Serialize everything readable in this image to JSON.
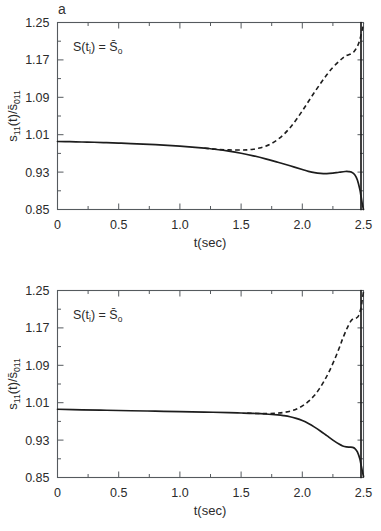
{
  "figure": {
    "panels": [
      {
        "label": "a",
        "annotation_main": "S(t",
        "annotation_sub1": "i",
        "annotation_mid": ") = S",
        "annotation_sub2": "o",
        "annotation_full": "S(ti) = S̄o"
      },
      {
        "label": "b",
        "annotation_main": "S(t",
        "annotation_sub1": "i",
        "annotation_mid": ") = S",
        "annotation_sub2": "o",
        "annotation_full": "S(ti) = S̄o"
      }
    ],
    "axes": {
      "xlabel": "t(sec)",
      "ylabel_main": "s",
      "ylabel_sub1": "11",
      "ylabel_mid": "(t)/s",
      "ylabel_sub2": "011",
      "ylabel_full": "s11(t)/s̄011",
      "xticks": [
        "0",
        "0.5",
        "1.0",
        "1.5",
        "2.0",
        "2.5"
      ],
      "yticks": [
        "0.85",
        "0.93",
        "1.01",
        "1.09",
        "1.17",
        "1.25"
      ]
    },
    "colors": {
      "background": "#ffffff",
      "frame": "#555a5e",
      "curve": "#1d1d1d",
      "text": "#2b2b2b"
    }
  },
  "chart_data": [
    {
      "type": "line",
      "title": "a",
      "xlabel": "t(sec)",
      "ylabel": "s11(t)/s̄011",
      "xlim": [
        0,
        2.5
      ],
      "ylim": [
        0.85,
        1.25
      ],
      "xticks": [
        0,
        0.5,
        1.0,
        1.5,
        2.0,
        2.5
      ],
      "yticks": [
        0.85,
        0.93,
        1.01,
        1.09,
        1.17,
        1.25
      ],
      "grid": false,
      "legend": "none",
      "annotations": [
        "S(ti) = S̄o"
      ],
      "minor_ticks_per_interval": 1,
      "series": [
        {
          "name": "solid",
          "style": "solid",
          "x": [
            0.0,
            0.1,
            0.2,
            0.3,
            0.4,
            0.5,
            0.6,
            0.7,
            0.8,
            0.9,
            1.0,
            1.1,
            1.2,
            1.3,
            1.4,
            1.5,
            1.6,
            1.7,
            1.8,
            1.9,
            2.0,
            2.05,
            2.1,
            2.15,
            2.2,
            2.25,
            2.3,
            2.35,
            2.38,
            2.4,
            2.43,
            2.45,
            2.47,
            2.48,
            2.49,
            2.5
          ],
          "y": [
            0.9955,
            0.995,
            0.9944,
            0.9938,
            0.993,
            0.9921,
            0.9911,
            0.9899,
            0.9886,
            0.9872,
            0.9855,
            0.9836,
            0.9812,
            0.9784,
            0.9748,
            0.9703,
            0.9648,
            0.9583,
            0.951,
            0.9435,
            0.9355,
            0.9317,
            0.9288,
            0.9272,
            0.9268,
            0.9278,
            0.9297,
            0.9313,
            0.9312,
            0.93,
            0.924,
            0.913,
            0.893,
            0.878,
            0.862,
            0.85
          ]
        },
        {
          "name": "dashed",
          "style": "dashed",
          "x": [
            1.2,
            1.3,
            1.4,
            1.5,
            1.55,
            1.6,
            1.65,
            1.7,
            1.75,
            1.8,
            1.85,
            1.9,
            1.95,
            2.0,
            2.05,
            2.1,
            2.15,
            2.2,
            2.25,
            2.3,
            2.33,
            2.36,
            2.39,
            2.42,
            2.45,
            2.47,
            2.49,
            2.5
          ],
          "y": [
            0.9812,
            0.9788,
            0.9775,
            0.9772,
            0.9776,
            0.979,
            0.9815,
            0.9855,
            0.9915,
            1.0,
            1.011,
            1.025,
            1.042,
            1.061,
            1.081,
            1.101,
            1.12,
            1.138,
            1.154,
            1.167,
            1.174,
            1.179,
            1.182,
            1.187,
            1.199,
            1.213,
            1.235,
            1.248
          ]
        }
      ]
    },
    {
      "type": "line",
      "title": "b",
      "xlabel": "t(sec)",
      "ylabel": "s11(t)/s̄011",
      "xlim": [
        0,
        2.5
      ],
      "ylim": [
        0.85,
        1.25
      ],
      "xticks": [
        0,
        0.5,
        1.0,
        1.5,
        2.0,
        2.5
      ],
      "yticks": [
        0.85,
        0.93,
        1.01,
        1.09,
        1.17,
        1.25
      ],
      "grid": false,
      "legend": "none",
      "annotations": [
        "S(ti) = S̄o"
      ],
      "minor_ticks_per_interval": 1,
      "series": [
        {
          "name": "solid",
          "style": "solid",
          "x": [
            0.0,
            0.2,
            0.4,
            0.6,
            0.8,
            1.0,
            1.2,
            1.4,
            1.5,
            1.6,
            1.7,
            1.8,
            1.85,
            1.9,
            1.95,
            2.0,
            2.05,
            2.1,
            2.15,
            2.2,
            2.25,
            2.3,
            2.33,
            2.36,
            2.39,
            2.41,
            2.43,
            2.45,
            2.47,
            2.48,
            2.49,
            2.5
          ],
          "y": [
            0.996,
            0.9948,
            0.9938,
            0.9928,
            0.9919,
            0.991,
            0.99,
            0.9888,
            0.988,
            0.9871,
            0.9858,
            0.9838,
            0.9822,
            0.98,
            0.9765,
            0.9718,
            0.9655,
            0.9578,
            0.949,
            0.9395,
            0.93,
            0.9215,
            0.9175,
            0.9155,
            0.915,
            0.9145,
            0.912,
            0.905,
            0.89,
            0.877,
            0.864,
            0.852
          ]
        },
        {
          "name": "dashed",
          "style": "dashed",
          "x": [
            1.55,
            1.65,
            1.72,
            1.78,
            1.82,
            1.86,
            1.9,
            1.94,
            1.98,
            2.02,
            2.06,
            2.1,
            2.14,
            2.18,
            2.22,
            2.26,
            2.3,
            2.33,
            2.36,
            2.38,
            2.4,
            2.42,
            2.44,
            2.46,
            2.48,
            2.49,
            2.5
          ],
          "y": [
            0.9876,
            0.9868,
            0.9866,
            0.9872,
            0.9882,
            0.9896,
            0.9918,
            0.995,
            0.9998,
            1.0065,
            1.015,
            1.026,
            1.04,
            1.057,
            1.077,
            1.1,
            1.126,
            1.147,
            1.166,
            1.177,
            1.186,
            1.19,
            1.191,
            1.196,
            1.213,
            1.231,
            1.247
          ]
        }
      ]
    }
  ]
}
